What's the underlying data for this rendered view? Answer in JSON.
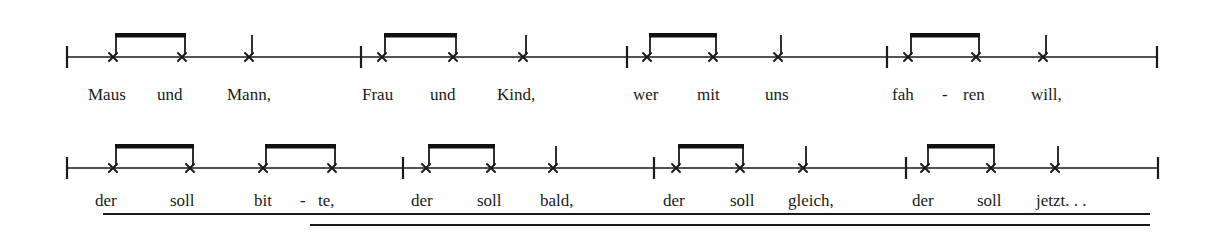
{
  "colors": {
    "ink": "#1a1a1a",
    "paper": "#ffffff"
  },
  "notation": {
    "notehead_style": "x-notehead",
    "stem_height": 22,
    "beam_height": 24,
    "beam_thickness": 4.5
  },
  "systems": [
    {
      "staff_y": 57,
      "x_start": 67,
      "x_end": 1157,
      "text_y": 100,
      "barlines": [
        67,
        361,
        627,
        887,
        1157
      ],
      "beamed_pairs": [
        [
          113,
          182
        ],
        [
          382,
          453
        ],
        [
          647,
          713
        ],
        [
          908,
          976
        ]
      ],
      "quarter_notes": [
        249,
        523,
        778,
        1043
      ],
      "lyrics": [
        {
          "text": "Maus",
          "x": 88
        },
        {
          "text": "und",
          "x": 157
        },
        {
          "text": "Mann,",
          "x": 227
        },
        {
          "text": "Frau",
          "x": 362
        },
        {
          "text": "und",
          "x": 430
        },
        {
          "text": "Kind,",
          "x": 497
        },
        {
          "text": "wer",
          "x": 633
        },
        {
          "text": "mit",
          "x": 697
        },
        {
          "text": "uns",
          "x": 765
        },
        {
          "text": "fah",
          "x": 892
        },
        {
          "text": "-",
          "x": 942
        },
        {
          "text": "ren",
          "x": 963
        },
        {
          "text": "will,",
          "x": 1031
        }
      ]
    },
    {
      "staff_y": 168,
      "x_start": 67,
      "x_end": 1158,
      "text_y": 206,
      "barlines": [
        67,
        403,
        654,
        906,
        1158
      ],
      "beamed_pairs": [
        [
          113,
          190
        ],
        [
          263,
          332
        ],
        [
          426,
          491
        ],
        [
          676,
          740
        ],
        [
          925,
          991
        ]
      ],
      "quarter_notes": [
        553,
        803,
        1055
      ],
      "lyrics": [
        {
          "text": "der",
          "x": 95
        },
        {
          "text": "soll",
          "x": 170
        },
        {
          "text": "bit",
          "x": 254
        },
        {
          "text": "-",
          "x": 300
        },
        {
          "text": "te,",
          "x": 318
        },
        {
          "text": "der",
          "x": 411
        },
        {
          "text": "soll",
          "x": 477
        },
        {
          "text": "bald,",
          "x": 540
        },
        {
          "text": "der",
          "x": 663
        },
        {
          "text": "soll",
          "x": 730
        },
        {
          "text": "gleich,",
          "x": 788
        },
        {
          "text": "der",
          "x": 912
        },
        {
          "text": "soll",
          "x": 977
        },
        {
          "text": "jetzt. . .",
          "x": 1036
        }
      ]
    }
  ],
  "double_underline": {
    "top": {
      "x1": 103,
      "x2": 1150,
      "y": 214
    },
    "bottom": {
      "x1": 310,
      "x2": 1150,
      "y": 225
    }
  }
}
